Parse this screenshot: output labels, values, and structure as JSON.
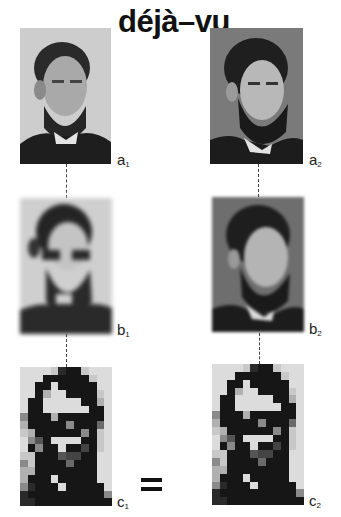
{
  "title": "déjà–vu",
  "equals_sign": "=",
  "panels": {
    "a1": {
      "label": "a",
      "sub": "1",
      "kind": "photograph",
      "subject": "bearded man portrait (left)"
    },
    "a2": {
      "label": "a",
      "sub": "2",
      "kind": "photograph",
      "subject": "bearded man portrait (right)"
    },
    "b1": {
      "label": "b",
      "sub": "1",
      "kind": "blurred photograph"
    },
    "b2": {
      "label": "b",
      "sub": "2",
      "kind": "blurred photograph"
    },
    "c1": {
      "label": "c",
      "sub": "1",
      "kind": "pixelated block image"
    },
    "c2": {
      "label": "c",
      "sub": "2",
      "kind": "pixelated block image"
    }
  },
  "pixel_grid": {
    "cols": 12,
    "rows": 18,
    "palette": [
      "#111111",
      "#161616",
      "#2a2a2a",
      "#444444",
      "#555555",
      "#6a6a6a",
      "#8a8a8a",
      "#b0b0b0",
      "#c8c8c8",
      "#dcdcdc"
    ],
    "cells": [
      [
        9,
        9,
        9,
        9,
        8,
        2,
        1,
        1,
        8,
        9,
        9,
        9
      ],
      [
        9,
        9,
        9,
        1,
        1,
        1,
        1,
        1,
        1,
        8,
        9,
        9
      ],
      [
        9,
        9,
        1,
        1,
        9,
        1,
        1,
        1,
        1,
        1,
        9,
        9
      ],
      [
        9,
        9,
        1,
        7,
        9,
        9,
        1,
        1,
        1,
        1,
        8,
        9
      ],
      [
        9,
        1,
        1,
        9,
        9,
        9,
        9,
        9,
        1,
        1,
        7,
        9
      ],
      [
        9,
        1,
        1,
        9,
        9,
        9,
        9,
        9,
        9,
        1,
        1,
        9
      ],
      [
        6,
        1,
        1,
        1,
        7,
        1,
        1,
        1,
        1,
        1,
        1,
        9
      ],
      [
        7,
        1,
        1,
        1,
        1,
        1,
        6,
        1,
        1,
        1,
        5,
        9
      ],
      [
        8,
        7,
        1,
        1,
        1,
        1,
        1,
        1,
        6,
        1,
        8,
        9
      ],
      [
        9,
        6,
        4,
        1,
        9,
        9,
        9,
        9,
        1,
        1,
        8,
        9
      ],
      [
        9,
        1,
        6,
        1,
        1,
        9,
        1,
        1,
        3,
        1,
        8,
        9
      ],
      [
        8,
        8,
        1,
        1,
        1,
        4,
        3,
        3,
        1,
        1,
        9,
        9
      ],
      [
        6,
        8,
        1,
        1,
        1,
        1,
        5,
        1,
        1,
        1,
        9,
        9
      ],
      [
        7,
        7,
        1,
        1,
        1,
        1,
        1,
        1,
        1,
        1,
        9,
        9
      ],
      [
        7,
        1,
        1,
        1,
        9,
        1,
        1,
        1,
        1,
        1,
        9,
        9
      ],
      [
        6,
        2,
        1,
        1,
        1,
        9,
        1,
        1,
        1,
        1,
        1,
        9
      ],
      [
        2,
        1,
        1,
        1,
        1,
        1,
        1,
        1,
        1,
        1,
        1,
        6
      ],
      [
        2,
        2,
        1,
        1,
        1,
        1,
        1,
        1,
        1,
        1,
        1,
        1
      ]
    ]
  }
}
